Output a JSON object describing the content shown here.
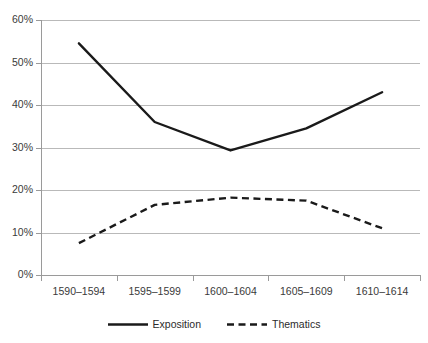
{
  "chart_data": {
    "type": "line",
    "title": "",
    "subtitle": "",
    "xlabel": "",
    "ylabel": "",
    "categories": [
      "1590–1594",
      "1595–1599",
      "1600–1604",
      "1605–1609",
      "1610–1614"
    ],
    "series": [
      {
        "name": "Exposition",
        "style": "solid",
        "color": "#1a1a1a",
        "values": [
          54.5,
          36.0,
          29.3,
          34.5,
          43.0
        ]
      },
      {
        "name": "Thematics",
        "style": "dashed",
        "color": "#1a1a1a",
        "values": [
          7.5,
          16.5,
          18.2,
          17.5,
          11.0
        ]
      }
    ],
    "ylim": [
      0,
      60
    ],
    "ytick_values": [
      0,
      10,
      20,
      30,
      40,
      50,
      60
    ],
    "ytick_labels": [
      "0%",
      "10%",
      "20%",
      "30%",
      "40%",
      "50%",
      "60%"
    ],
    "grid": true,
    "grid_color": "#b9b9b9",
    "axis_color": "#9a9a9a",
    "legend_position": "bottom"
  },
  "legend": {
    "items": [
      {
        "label": "Exposition",
        "style": "solid"
      },
      {
        "label": "Thematics",
        "style": "dashed"
      }
    ]
  }
}
